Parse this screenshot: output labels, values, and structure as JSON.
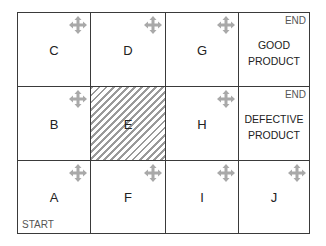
{
  "grid": {
    "rows": [
      [
        {
          "id": "C",
          "label": "C",
          "move_icon": true
        },
        {
          "id": "D",
          "label": "D",
          "move_icon": true
        },
        {
          "id": "G",
          "label": "G",
          "move_icon": true
        },
        {
          "id": "good",
          "tag": "END",
          "text_line1": "GOOD",
          "text_line2": "PRODUCT"
        }
      ],
      [
        {
          "id": "B",
          "label": "B",
          "move_icon": true
        },
        {
          "id": "E",
          "label": "E",
          "blocked": true
        },
        {
          "id": "H",
          "label": "H",
          "move_icon": true
        },
        {
          "id": "defective",
          "tag": "END",
          "text_line1": "DEFECTIVE",
          "text_line2": "PRODUCT"
        }
      ],
      [
        {
          "id": "A",
          "label": "A",
          "move_icon": true,
          "tag": "START"
        },
        {
          "id": "F",
          "label": "F",
          "move_icon": true
        },
        {
          "id": "I",
          "label": "I",
          "move_icon": true
        },
        {
          "id": "J",
          "label": "J",
          "move_icon": true
        }
      ]
    ]
  },
  "icons": {
    "move": "four-direction-arrow-icon"
  },
  "colors": {
    "border": "#3a3a3a",
    "icon": "#a9a9a9",
    "hatch": "#9a9a9a"
  }
}
